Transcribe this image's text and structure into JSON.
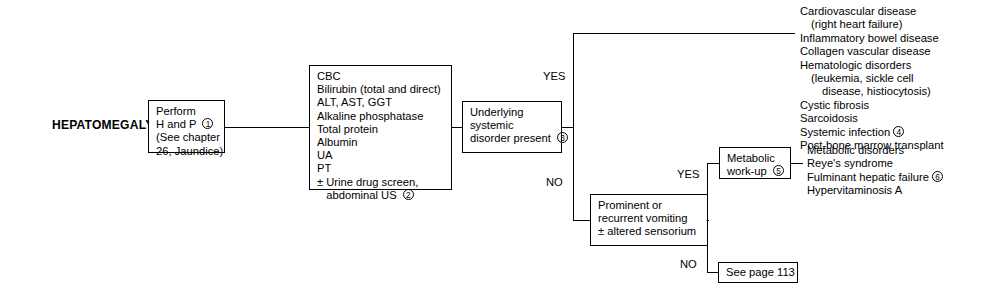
{
  "diagram": {
    "root_label": "HEPATOMEGALY",
    "line_color": "#000000",
    "background_color": "#ffffff"
  },
  "boxes": {
    "perform_hp": {
      "lines": [
        "Perform",
        "H and P",
        "(See chapter",
        "26, Jaundice)"
      ],
      "marker": "1",
      "marker_after_line": 2
    },
    "labs": {
      "lines": [
        "CBC",
        "Bilirubin (total and direct)",
        "ALT, AST, GGT",
        "Alkaline phosphatase",
        "Total protein",
        "Albumin",
        "UA",
        "PT",
        "± Urine drug screen,",
        "   abdominal US"
      ],
      "marker": "2",
      "marker_after_line": 10
    },
    "systemic_disorder": {
      "lines": [
        "Underlying",
        "systemic",
        "disorder present"
      ],
      "marker": "3",
      "marker_after_line": 3
    },
    "vomiting": {
      "lines": [
        "Prominent or",
        "recurrent vomiting",
        "± altered sensorium"
      ],
      "marker": "",
      "marker_after_line": 0
    },
    "metabolic_workup": {
      "lines": [
        "Metabolic",
        "work-up"
      ],
      "marker": "5",
      "marker_after_line": 2
    },
    "see_page": {
      "lines": [
        "See page 113"
      ],
      "marker": "",
      "marker_after_line": 0
    }
  },
  "branch_labels": {
    "systemic_yes": "YES",
    "systemic_no": "NO",
    "vomiting_yes": "YES",
    "vomiting_no": "NO"
  },
  "outcome_lists": {
    "systemic_yes_list": {
      "entries": [
        {
          "text": "Cardiovascular disease",
          "indent": 0,
          "marker": ""
        },
        {
          "text": "(right heart failure)",
          "indent": 1,
          "marker": ""
        },
        {
          "text": "Inflammatory bowel disease",
          "indent": 0,
          "marker": ""
        },
        {
          "text": "Collagen vascular disease",
          "indent": 0,
          "marker": ""
        },
        {
          "text": "Hematologic disorders",
          "indent": 0,
          "marker": ""
        },
        {
          "text": "(leukemia, sickle cell",
          "indent": 1,
          "marker": ""
        },
        {
          "text": "disease, histiocytosis)",
          "indent": 2,
          "marker": ""
        },
        {
          "text": "Cystic fibrosis",
          "indent": 0,
          "marker": ""
        },
        {
          "text": "Sarcoidosis",
          "indent": 0,
          "marker": ""
        },
        {
          "text": "Systemic infection",
          "indent": 0,
          "marker": "4"
        },
        {
          "text": "Post-bone marrow transplant",
          "indent": 0,
          "marker": ""
        }
      ]
    },
    "metabolic_list": {
      "entries": [
        {
          "text": "Metabolic disorders",
          "indent": 0,
          "marker": ""
        },
        {
          "text": "Reye's syndrome",
          "indent": 0,
          "marker": ""
        },
        {
          "text": "Fulminant hepatic failure",
          "indent": 0,
          "marker": "6"
        },
        {
          "text": "Hypervitaminosis A",
          "indent": 0,
          "marker": ""
        }
      ]
    }
  }
}
